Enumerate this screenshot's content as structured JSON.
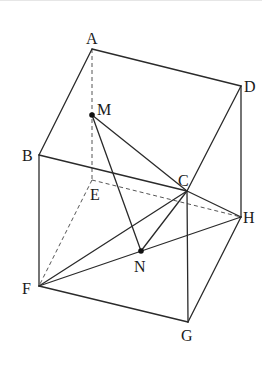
{
  "diagram": {
    "type": "geometry-cube",
    "vertices": {
      "A": {
        "label": "A",
        "x": 92,
        "y": 49
      },
      "B": {
        "label": "B",
        "x": 39,
        "y": 155
      },
      "C": {
        "label": "C",
        "x": 187,
        "y": 191
      },
      "D": {
        "label": "D",
        "x": 241,
        "y": 86
      },
      "E": {
        "label": "E",
        "x": 92,
        "y": 180
      },
      "F": {
        "label": "F",
        "x": 39,
        "y": 286
      },
      "G": {
        "label": "G",
        "x": 188,
        "y": 322
      },
      "H": {
        "label": "H",
        "x": 241,
        "y": 217
      }
    },
    "points": {
      "M": {
        "label": "M",
        "x": 92,
        "y": 115
      },
      "N": {
        "label": "N",
        "x": 141,
        "y": 251
      }
    },
    "solid_edges": [
      "AB",
      "AD",
      "BC",
      "CD",
      "BF",
      "CG",
      "DH",
      "FG",
      "GH",
      "CF",
      "CH",
      "FH",
      "MC",
      "MN",
      "NC"
    ],
    "dashed_edges": [
      "AE",
      "EF",
      "EH"
    ],
    "colors": {
      "line": "#2a2a2a",
      "dashed": "#555555",
      "background": "#ffffff"
    }
  }
}
